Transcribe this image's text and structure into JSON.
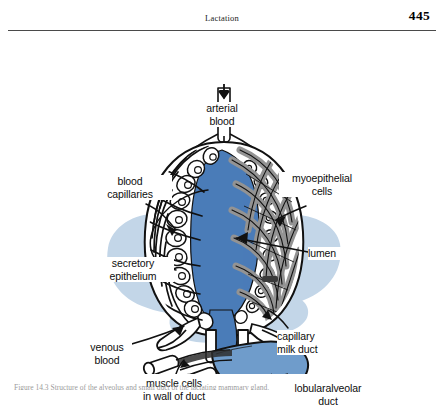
{
  "header": {
    "title": "Lactation",
    "page_number": "445"
  },
  "figure": {
    "name": "mammary-alveolus-diagram",
    "labels": {
      "arterial_blood": "arterial\nblood",
      "blood_capillaries": "blood\ncapillaries",
      "myoepithelial_cells": "myoepithelial\ncells",
      "secretory_epithelium": "secretory\nepithelium",
      "lumen": "lumen",
      "venous_blood": "venous\nblood",
      "capillary_milk_duct": "capillary\nmilk duct",
      "muscle_cells": "muscle cells\nin wall of duct",
      "lobularalveolar_duct": "lobularalveolar\nduct"
    },
    "caption": "Figure 14.3 Structure of the alveolus and small duct of the lactating mammary gland.",
    "colors": {
      "lumen_blue": "#4a7cb8",
      "halo_blue": "#c3d6e8",
      "duct_blue": "#6f9ccb",
      "myoepithelial_gray": "#939393",
      "outline_black": "#111111",
      "page_white": "#ffffff",
      "rule_gray": "#4a4a4a"
    }
  }
}
